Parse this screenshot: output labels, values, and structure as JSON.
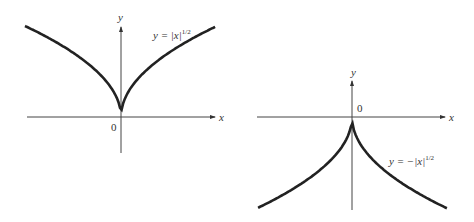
{
  "chart_data": [
    {
      "type": "line",
      "title": "",
      "equation_label": "y = |x|^1/2",
      "equation_base": "y = |x|",
      "equation_exp": "1/2",
      "xlabel": "x",
      "ylabel": "y",
      "origin_label": "0",
      "series": [
        {
          "name": "y = |x|^(1/2)",
          "x": [
            -4,
            -2,
            -1,
            -0.25,
            0,
            0.25,
            1,
            2,
            4
          ],
          "values": [
            2,
            1.414,
            1,
            0.5,
            0,
            0.5,
            1,
            1.414,
            2
          ]
        }
      ],
      "grid": false,
      "legend": "none"
    },
    {
      "type": "line",
      "title": "",
      "equation_label": "y = -|x|^1/2",
      "equation_base": "y = −|x|",
      "equation_exp": "1/2",
      "xlabel": "x",
      "ylabel": "y",
      "origin_label": "0",
      "series": [
        {
          "name": "y = -|x|^(1/2)",
          "x": [
            -4,
            -2,
            -1,
            -0.25,
            0,
            0.25,
            1,
            2,
            4
          ],
          "values": [
            -2,
            -1.414,
            -1,
            -0.5,
            0,
            -0.5,
            -1,
            -1.414,
            -2
          ]
        }
      ],
      "grid": false,
      "legend": "none"
    }
  ]
}
